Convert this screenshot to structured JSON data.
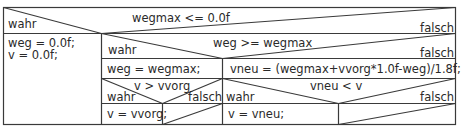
{
  "diagram": {
    "type": "nassi-shneiderman-structogram",
    "block1": {
      "condition": "wegmax <= 0.0f",
      "true_label": "wahr",
      "false_label": "falsch",
      "true_branch": [
        "weg = 0.0f;",
        "v = 0.0f;"
      ]
    },
    "block2": {
      "condition": "weg >= wegmax",
      "true_label": "wahr",
      "false_label": "falsch",
      "true_branch_statement": "weg = wegmax;",
      "false_branch_statement": "vneu = (wegmax+vvorg*1.0f-weg)/1.8f;"
    },
    "block3": {
      "condition": "v > vvorg",
      "true_label": "wahr",
      "false_label": "falsch",
      "true_branch_statement": "v = vvorg;",
      "false_branch_statement": ""
    },
    "block4": {
      "condition": "vneu < v",
      "true_label": "wahr",
      "false_label": "falsch",
      "true_branch_statement": "v = vneu;",
      "false_branch_statement": ""
    },
    "colors": {
      "line": "#3a3a3a",
      "text": "#2a2a2a",
      "background": "#ffffff"
    }
  }
}
